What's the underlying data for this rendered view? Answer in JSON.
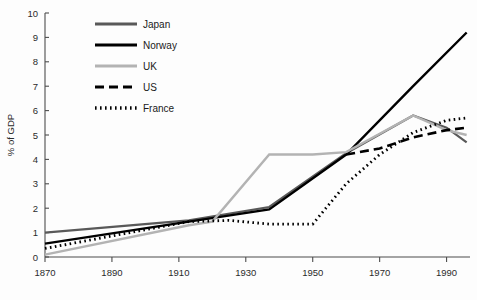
{
  "chart_data": {
    "type": "line",
    "title": "",
    "xlabel": "",
    "ylabel": "% of GDP",
    "xlim": [
      1870,
      1997
    ],
    "ylim": [
      0,
      10
    ],
    "grid": false,
    "legend_position": "top-left-inside",
    "xticks": [
      1870,
      1890,
      1910,
      1930,
      1950,
      1970,
      1990
    ],
    "xtick_labels": [
      "1870",
      "1890",
      "1910",
      "1930",
      "1950",
      "1970",
      "1990"
    ],
    "yticks": [
      0,
      1,
      2,
      3,
      4,
      5,
      6,
      7,
      8,
      9,
      10
    ],
    "ytick_labels": [
      "0",
      "1",
      "2",
      "3",
      "4",
      "5",
      "6",
      "7",
      "8",
      "9",
      "10"
    ],
    "series": [
      {
        "name": "Japan",
        "color": "#595959",
        "dash": "none",
        "width": 2.2,
        "x": [
          1870,
          1913,
          1937,
          1960,
          1980,
          1990,
          1996
        ],
        "y": [
          1.0,
          1.5,
          2.05,
          4.25,
          5.8,
          5.3,
          4.7
        ]
      },
      {
        "name": "Norway",
        "color": "#000000",
        "dash": "none",
        "width": 2.4,
        "x": [
          1870,
          1913,
          1937,
          1960,
          1980,
          1996
        ],
        "y": [
          0.55,
          1.45,
          1.95,
          4.2,
          7.0,
          9.2
        ]
      },
      {
        "name": "UK",
        "color": "#b3b3b3",
        "dash": "none",
        "width": 2.4,
        "x": [
          1870,
          1913,
          1920,
          1937,
          1950,
          1960,
          1980,
          1990,
          1996
        ],
        "y": [
          0.1,
          1.3,
          1.45,
          4.2,
          4.2,
          4.3,
          5.8,
          5.2,
          5.0
        ]
      },
      {
        "name": "US",
        "color": "#000000",
        "dash": "9,5",
        "width": 2.6,
        "x": [
          1960,
          1970,
          1980,
          1990,
          1996
        ],
        "y": [
          4.2,
          4.45,
          4.9,
          5.2,
          5.3
        ]
      },
      {
        "name": "France",
        "color": "#000000",
        "dash": "1.6,3.4",
        "width": 2.8,
        "x": [
          1870,
          1913,
          1925,
          1937,
          1950,
          1960,
          1970,
          1980,
          1990,
          1996
        ],
        "y": [
          0.35,
          1.45,
          1.5,
          1.35,
          1.35,
          3.0,
          4.2,
          5.1,
          5.6,
          5.7
        ]
      }
    ]
  },
  "legend": {
    "items": [
      {
        "label": "Japan"
      },
      {
        "label": "Norway"
      },
      {
        "label": "UK"
      },
      {
        "label": "US"
      },
      {
        "label": "France"
      }
    ]
  }
}
